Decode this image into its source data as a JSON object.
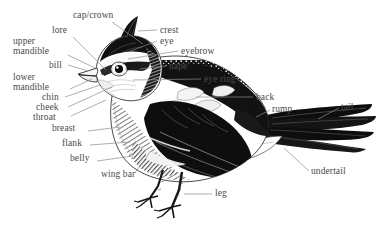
{
  "diagram": {
    "style": "black-and-white pen-and-ink / engraving illustration with leader lines",
    "background_color": "#ffffff",
    "ink_color": "#111111",
    "label_color": "#4a4a4a",
    "leader_color": "#8c8c8c",
    "label_count": 22
  },
  "labels": [
    {
      "id": "cap-crown",
      "text": "cap/crown",
      "align": "l",
      "x": 73,
      "y": 10,
      "lx": 112,
      "ly": 22,
      "tx": 143,
      "ty": 44
    },
    {
      "id": "lore",
      "text": "lore",
      "align": "l",
      "x": 52,
      "y": 25,
      "lx": 73,
      "ly": 37,
      "tx": 107,
      "ty": 71
    },
    {
      "id": "upper-mandible",
      "text": "upper\nmandible",
      "align": "l",
      "x": 13,
      "y": 36,
      "lx": 68,
      "ly": 55,
      "tx": 100,
      "ty": 67
    },
    {
      "id": "bill",
      "text": "bill",
      "align": "l",
      "x": 49,
      "y": 60,
      "lx": 68,
      "ly": 65,
      "tx": 96,
      "ty": 72
    },
    {
      "id": "lower-mandible",
      "text": "lower\nmandible",
      "align": "l",
      "x": 13,
      "y": 72,
      "lx": 70,
      "ly": 89,
      "tx": 99,
      "ty": 78
    },
    {
      "id": "chin",
      "text": "chin",
      "align": "l",
      "x": 42,
      "y": 92,
      "lx": 65,
      "ly": 97,
      "tx": 100,
      "ty": 85
    },
    {
      "id": "cheek",
      "text": "cheek",
      "align": "l",
      "x": 36,
      "y": 102,
      "lx": 68,
      "ly": 107,
      "tx": 108,
      "ty": 85
    },
    {
      "id": "throat",
      "text": "throat",
      "align": "l",
      "x": 33,
      "y": 112,
      "lx": 71,
      "ly": 116,
      "tx": 104,
      "ty": 100
    },
    {
      "id": "breast",
      "text": "breast",
      "align": "l",
      "x": 52,
      "y": 127,
      "lx": 88,
      "ly": 131,
      "tx": 118,
      "ty": 127
    },
    {
      "id": "flank",
      "text": "flank",
      "align": "l",
      "x": 62,
      "y": 141,
      "lx": 90,
      "ly": 145,
      "tx": 128,
      "ty": 142
    },
    {
      "id": "belly",
      "text": "belly",
      "align": "l",
      "x": 70,
      "y": 157,
      "lx": 97,
      "ly": 161,
      "tx": 131,
      "ty": 157
    },
    {
      "id": "wing-bar",
      "text": "wing bar",
      "align": "l",
      "x": 101,
      "y": 175,
      "lx": 135,
      "ly": 173,
      "tx": 146,
      "ty": 152
    },
    {
      "id": "crest",
      "text": "crest",
      "align": "l",
      "x": 160,
      "y": 25,
      "lx": 157,
      "ly": 30,
      "tx": 137,
      "ty": 31
    },
    {
      "id": "eye",
      "text": "eye",
      "align": "l",
      "x": 160,
      "y": 36,
      "lx": 157,
      "ly": 41,
      "tx": 128,
      "ty": 52
    },
    {
      "id": "eyebrow",
      "text": "eyebrow",
      "align": "l",
      "x": 181,
      "y": 47,
      "lx": 178,
      "ly": 51,
      "tx": 126,
      "ly2": 58,
      "ty": 58
    },
    {
      "id": "nape",
      "text": "nape",
      "align": "l",
      "x": 169,
      "y": 62,
      "lx": 166,
      "ly": 66,
      "tx": 137,
      "ty": 69
    },
    {
      "id": "eye-ring",
      "text": "eye ring",
      "align": "l",
      "x": 204,
      "y": 75,
      "lx": 201,
      "ly": 79,
      "tx": 131,
      "ty": 80
    },
    {
      "id": "back",
      "text": "back",
      "align": "l",
      "x": 256,
      "y": 93,
      "lx": 253,
      "ly": 97,
      "tx": 196,
      "ty": 97
    },
    {
      "id": "rump",
      "text": "rump",
      "align": "l",
      "x": 272,
      "y": 105,
      "lx": 270,
      "ly": 109,
      "tx": 254,
      "ty": 117
    },
    {
      "id": "tail",
      "text": "tail",
      "align": "l",
      "x": 341,
      "y": 103,
      "lx": 339,
      "ly": 108,
      "tx": 318,
      "ty": 119
    },
    {
      "id": "undertail",
      "text": "undertail",
      "align": "l",
      "x": 311,
      "y": 172,
      "lx": 309,
      "ly": 172,
      "tx": 287,
      "ty": 149
    },
    {
      "id": "leg",
      "text": "leg",
      "align": "l",
      "x": 215,
      "y": 190,
      "lx": 212,
      "ly": 194,
      "tx": 184,
      "ty": 194
    }
  ]
}
